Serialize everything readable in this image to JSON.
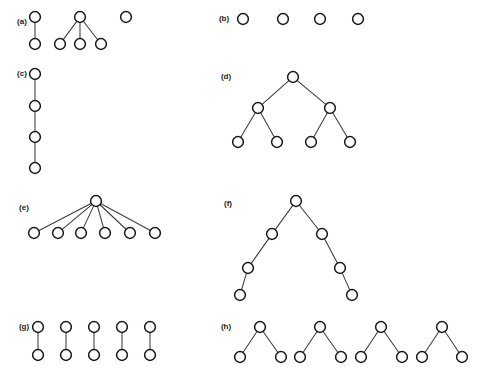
{
  "figure": {
    "width": 477,
    "height": 379,
    "background_color": "#ffffff",
    "node_fill_color": "#ffffff",
    "node_stroke_color": "#161616",
    "edge_color": "#3c3c3c",
    "node_radius": 5.4,
    "panels": [
      {
        "id": "a",
        "label": "(a)",
        "label_pos": [
          22,
          22
        ],
        "description": "One 2-node edge, one star with three leaves, one isolated node",
        "nodes": [
          {
            "id": "a1",
            "x": 35,
            "y": 17
          },
          {
            "id": "a2",
            "x": 35,
            "y": 44
          },
          {
            "id": "a3",
            "x": 80,
            "y": 17
          },
          {
            "id": "a4",
            "x": 60,
            "y": 44
          },
          {
            "id": "a5",
            "x": 80,
            "y": 44
          },
          {
            "id": "a6",
            "x": 101,
            "y": 44
          },
          {
            "id": "a7",
            "x": 126,
            "y": 17
          }
        ],
        "edges": [
          [
            "a1",
            "a2"
          ],
          [
            "a3",
            "a4"
          ],
          [
            "a3",
            "a5"
          ],
          [
            "a3",
            "a6"
          ]
        ]
      },
      {
        "id": "b",
        "label": "(b)",
        "label_pos": [
          224,
          19
        ],
        "description": "Four isolated nodes",
        "nodes": [
          {
            "id": "b1",
            "x": 243,
            "y": 19
          },
          {
            "id": "b2",
            "x": 283,
            "y": 19
          },
          {
            "id": "b3",
            "x": 320,
            "y": 19
          },
          {
            "id": "b4",
            "x": 358,
            "y": 19
          }
        ],
        "edges": []
      },
      {
        "id": "c",
        "label": "(c)",
        "label_pos": [
          22,
          74
        ],
        "description": "Vertical path of four nodes",
        "nodes": [
          {
            "id": "c1",
            "x": 35,
            "y": 74
          },
          {
            "id": "c2",
            "x": 35,
            "y": 106
          },
          {
            "id": "c3",
            "x": 35,
            "y": 137
          },
          {
            "id": "c4",
            "x": 35,
            "y": 168
          }
        ],
        "edges": [
          [
            "c1",
            "c2"
          ],
          [
            "c2",
            "c3"
          ],
          [
            "c3",
            "c4"
          ]
        ]
      },
      {
        "id": "d",
        "label": "(d)",
        "label_pos": [
          226,
          77
        ],
        "description": "Complete binary tree of depth two, seven nodes",
        "nodes": [
          {
            "id": "d1",
            "x": 293,
            "y": 77
          },
          {
            "id": "d2",
            "x": 258,
            "y": 108
          },
          {
            "id": "d3",
            "x": 330,
            "y": 108
          },
          {
            "id": "d4",
            "x": 238,
            "y": 142
          },
          {
            "id": "d5",
            "x": 277,
            "y": 142
          },
          {
            "id": "d6",
            "x": 311,
            "y": 142
          },
          {
            "id": "d7",
            "x": 350,
            "y": 142
          }
        ],
        "edges": [
          [
            "d1",
            "d2"
          ],
          [
            "d1",
            "d3"
          ],
          [
            "d2",
            "d4"
          ],
          [
            "d2",
            "d5"
          ],
          [
            "d3",
            "d6"
          ],
          [
            "d3",
            "d7"
          ]
        ]
      },
      {
        "id": "e",
        "label": "(e)",
        "label_pos": [
          24,
          208
        ],
        "description": "Star with one center and six leaves",
        "nodes": [
          {
            "id": "e0",
            "x": 96,
            "y": 201
          },
          {
            "id": "e1",
            "x": 34,
            "y": 233
          },
          {
            "id": "e2",
            "x": 58,
            "y": 233
          },
          {
            "id": "e3",
            "x": 81,
            "y": 233
          },
          {
            "id": "e4",
            "x": 105,
            "y": 233
          },
          {
            "id": "e5",
            "x": 130,
            "y": 233
          },
          {
            "id": "e6",
            "x": 155,
            "y": 233
          }
        ],
        "edges": [
          [
            "e0",
            "e1"
          ],
          [
            "e0",
            "e2"
          ],
          [
            "e0",
            "e3"
          ],
          [
            "e0",
            "e4"
          ],
          [
            "e0",
            "e5"
          ],
          [
            "e0",
            "e6"
          ]
        ]
      },
      {
        "id": "f",
        "label": "(f)",
        "label_pos": [
          228,
          204
        ],
        "description": "Root with two descending chains of three nodes each",
        "nodes": [
          {
            "id": "f1",
            "x": 296,
            "y": 201
          },
          {
            "id": "f2",
            "x": 272,
            "y": 234
          },
          {
            "id": "f3",
            "x": 248,
            "y": 268
          },
          {
            "id": "f4",
            "x": 240,
            "y": 295
          },
          {
            "id": "f5",
            "x": 322,
            "y": 234
          },
          {
            "id": "f6",
            "x": 340,
            "y": 268
          },
          {
            "id": "f7",
            "x": 352,
            "y": 295
          }
        ],
        "edges": [
          [
            "f1",
            "f2"
          ],
          [
            "f2",
            "f3"
          ],
          [
            "f3",
            "f4"
          ],
          [
            "f1",
            "f5"
          ],
          [
            "f5",
            "f6"
          ],
          [
            "f6",
            "f7"
          ]
        ]
      },
      {
        "id": "g",
        "label": "(g)",
        "label_pos": [
          24,
          327
        ],
        "description": "Five disjoint edges, each a vertical pair of nodes",
        "nodes": [
          {
            "id": "g1a",
            "x": 38,
            "y": 327
          },
          {
            "id": "g1b",
            "x": 38,
            "y": 355
          },
          {
            "id": "g2a",
            "x": 66,
            "y": 327
          },
          {
            "id": "g2b",
            "x": 66,
            "y": 355
          },
          {
            "id": "g3a",
            "x": 94,
            "y": 327
          },
          {
            "id": "g3b",
            "x": 94,
            "y": 355
          },
          {
            "id": "g4a",
            "x": 122,
            "y": 327
          },
          {
            "id": "g4b",
            "x": 122,
            "y": 355
          },
          {
            "id": "g5a",
            "x": 150,
            "y": 327
          },
          {
            "id": "g5b",
            "x": 150,
            "y": 355
          }
        ],
        "edges": [
          [
            "g1a",
            "g1b"
          ],
          [
            "g2a",
            "g2b"
          ],
          [
            "g3a",
            "g3b"
          ],
          [
            "g4a",
            "g4b"
          ],
          [
            "g5a",
            "g5b"
          ]
        ]
      },
      {
        "id": "h",
        "label": "(h)",
        "label_pos": [
          226,
          327
        ],
        "description": "Four disjoint cherries, each a root with two leaves",
        "nodes": [
          {
            "id": "h1c",
            "x": 260,
            "y": 327
          },
          {
            "id": "h1l",
            "x": 240,
            "y": 357
          },
          {
            "id": "h1r",
            "x": 281,
            "y": 357
          },
          {
            "id": "h2c",
            "x": 320,
            "y": 327
          },
          {
            "id": "h2l",
            "x": 300,
            "y": 357
          },
          {
            "id": "h2r",
            "x": 341,
            "y": 357
          },
          {
            "id": "h3c",
            "x": 381,
            "y": 327
          },
          {
            "id": "h3l",
            "x": 361,
            "y": 357
          },
          {
            "id": "h3r",
            "x": 402,
            "y": 357
          },
          {
            "id": "h4c",
            "x": 442,
            "y": 327
          },
          {
            "id": "h4l",
            "x": 422,
            "y": 357
          },
          {
            "id": "h4r",
            "x": 462,
            "y": 357
          }
        ],
        "edges": [
          [
            "h1c",
            "h1l"
          ],
          [
            "h1c",
            "h1r"
          ],
          [
            "h2c",
            "h2l"
          ],
          [
            "h2c",
            "h2r"
          ],
          [
            "h3c",
            "h3l"
          ],
          [
            "h3c",
            "h3r"
          ],
          [
            "h4c",
            "h4l"
          ],
          [
            "h4c",
            "h4r"
          ]
        ]
      }
    ]
  }
}
